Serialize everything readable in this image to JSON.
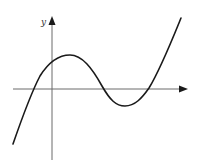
{
  "figure": {
    "type": "function-graph",
    "axes": {
      "y_label": "y",
      "x_label": ""
    },
    "colors": {
      "axis": "#6a6a6a",
      "curve": "#1a1a1a",
      "background": "#ffffff"
    }
  }
}
